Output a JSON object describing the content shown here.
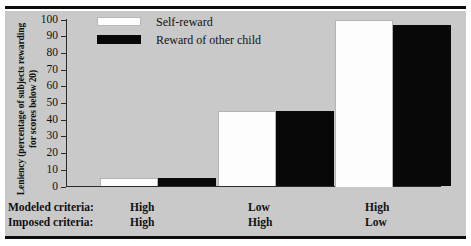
{
  "chart_data": {
    "type": "bar",
    "title": "",
    "xlabel": "",
    "ylabel": "Leniency (percentage of subjects rewarding for scores below 20)",
    "ylim": [
      0,
      100
    ],
    "yticks": [
      0,
      10,
      20,
      30,
      40,
      50,
      60,
      70,
      80,
      90,
      100
    ],
    "grid": false,
    "legend_position": "top-left",
    "categories": [
      "High / High",
      "Low / High",
      "High / Low"
    ],
    "condition_rows": [
      {
        "label": "Modeled criteria:",
        "values": [
          "High",
          "Low",
          "High"
        ]
      },
      {
        "label": "Imposed criteria:",
        "values": [
          "High",
          "High",
          "Low"
        ]
      }
    ],
    "series": [
      {
        "name": "Self-reward",
        "color": "#ffffff",
        "values": [
          5,
          45,
          100
        ]
      },
      {
        "name": "Reward of other child",
        "color": "#000000",
        "values": [
          5,
          45,
          97
        ]
      }
    ]
  },
  "legend": {
    "items": [
      {
        "label": "Self-reward",
        "swatch": "white-swatch"
      },
      {
        "label": "Reward of other child",
        "swatch": "black-swatch"
      }
    ]
  },
  "axis": {
    "y_title": "Leniency (percentage of subjects rewarding for scores below 20)",
    "tick_labels": [
      "100",
      "90",
      "80",
      "70",
      "60",
      "50",
      "40",
      "30",
      "20",
      "10",
      "0"
    ]
  },
  "colors": {
    "plate": "#c9c9c9",
    "rule": "#0d0d0d",
    "bar_self": "#fdfdfd",
    "bar_other": "#080808",
    "axis": "#2a2a2a"
  }
}
